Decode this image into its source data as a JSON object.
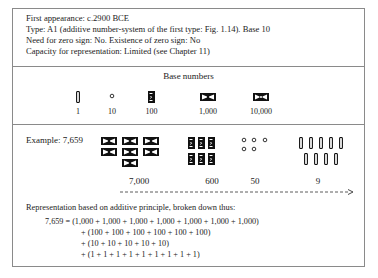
{
  "header": {
    "lines": [
      "First appearance: c.2900 BCE",
      "Type: A1 (additive number-system of the first type: Fig. 1.14). Base 10",
      "Need for zero sign: No. Existence of zero sign: No",
      "Capacity for representation: Limited (see Chapter 11)"
    ]
  },
  "base_numbers": {
    "title": "Base numbers",
    "items": [
      {
        "value": "1",
        "glyph": "vertical-stroke-icon"
      },
      {
        "value": "10",
        "glyph": "small-circle-icon"
      },
      {
        "value": "100",
        "glyph": "rectangle-coil-icon"
      },
      {
        "value": "1,000",
        "glyph": "bowtie-cartouche-icon"
      },
      {
        "value": "10,000",
        "glyph": "bowtie-cartouche-dot-icon"
      }
    ]
  },
  "example": {
    "label": "Example: 7,659",
    "groups": [
      {
        "value": "7,000",
        "count": 7,
        "glyph": "bowtie-cartouche-icon"
      },
      {
        "value": "600",
        "count": 6,
        "glyph": "rectangle-coil-icon"
      },
      {
        "value": "50",
        "count": 5,
        "glyph": "small-circle-icon"
      },
      {
        "value": "9",
        "count": 9,
        "glyph": "vertical-stroke-icon"
      }
    ],
    "direction": "left-to-right-arrow"
  },
  "representation": {
    "intro": "Representation based on additive principle, broken down thus:",
    "lines": [
      "7,659 = (1,000 + 1,000 + 1,000 + 1,000 + 1,000 + 1,000 + 1,000)",
      "+ (100 + 100 + 100 + 100 + 100 + 100)",
      "+ (10 + 10 + 10 + 10 + 10)",
      "+ (1 + 1 + 1 + 1 + 1 + 1 + 1 + 1 + 1)"
    ]
  }
}
